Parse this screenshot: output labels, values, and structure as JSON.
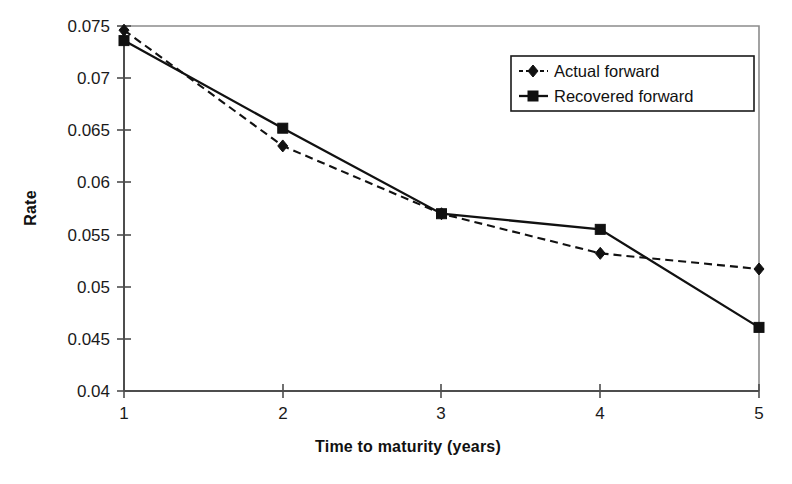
{
  "chart_data": {
    "type": "line",
    "title": "",
    "xlabel": "Time to maturity (years)",
    "ylabel": "Rate",
    "x": [
      1,
      2,
      3,
      4,
      5
    ],
    "xticklabels": [
      "1",
      "2",
      "3",
      "4",
      "5"
    ],
    "yticklabels": [
      "0.04",
      "0.045",
      "0.05",
      "0.055",
      "0.06",
      "0.065",
      "0.07",
      "0.075"
    ],
    "yticks": [
      0.04,
      0.045,
      0.05,
      0.055,
      0.06,
      0.065,
      0.07,
      0.075
    ],
    "xlim": [
      1,
      5
    ],
    "ylim": [
      0.04,
      0.075
    ],
    "grid": false,
    "legend_position": "top-right",
    "series": [
      {
        "name": "Actual forward",
        "values": [
          0.0746,
          0.0635,
          0.057,
          0.0532,
          0.0517
        ],
        "style": "dashed",
        "marker": "diamond",
        "color": "#111111"
      },
      {
        "name": "Recovered forward",
        "values": [
          0.0736,
          0.0652,
          0.057,
          0.0555,
          0.0461
        ],
        "style": "solid",
        "marker": "square",
        "color": "#111111"
      }
    ]
  },
  "axes": {
    "y_title": "Rate",
    "x_title": "Time to maturity (years)",
    "y_tick_0": "0.075",
    "y_tick_1": "0.07",
    "y_tick_2": "0.065",
    "y_tick_3": "0.06",
    "y_tick_4": "0.055",
    "y_tick_5": "0.05",
    "y_tick_6": "0.045",
    "y_tick_7": "0.04",
    "x_tick_0": "1",
    "x_tick_1": "2",
    "x_tick_2": "3",
    "x_tick_3": "4",
    "x_tick_4": "5"
  },
  "legend": {
    "entry_0": "Actual forward",
    "entry_1": "Recovered forward"
  },
  "colors": {
    "ink": "#111111",
    "axis": "#4d4d4d",
    "frame": "#8c8c8c",
    "background": "#ffffff"
  }
}
